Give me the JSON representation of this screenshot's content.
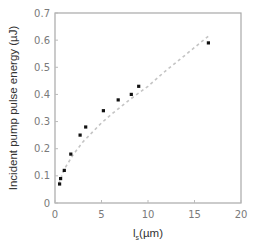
{
  "chart_data": {
    "type": "scatter",
    "title": "",
    "xlabel": "l_s(µm)",
    "xlabel_main": "l",
    "xlabel_sub": "s",
    "xlabel_unit": "(µm)",
    "ylabel": "Incident pump pulse energy (µJ)",
    "xlim": [
      0,
      20
    ],
    "ylim": [
      0,
      0.7
    ],
    "x_ticks": [
      "0",
      "5",
      "10",
      "15",
      "20"
    ],
    "y_ticks": [
      "0",
      "0.1",
      "0.2",
      "0.3",
      "0.4",
      "0.5",
      "0.6",
      "0.7"
    ],
    "grid": false,
    "legend": null,
    "series": [
      {
        "name": "measured",
        "style": "markers",
        "color": "#111111",
        "x": [
          0.5,
          0.6,
          1.0,
          1.7,
          2.7,
          3.3,
          5.2,
          6.8,
          8.2,
          9.0,
          16.5
        ],
        "y": [
          0.07,
          0.09,
          0.12,
          0.18,
          0.25,
          0.28,
          0.34,
          0.38,
          0.4,
          0.43,
          0.59
        ]
      },
      {
        "name": "fit",
        "style": "dashed-line",
        "color": "#c0c0c0",
        "x": [
          0.4,
          1,
          2,
          3,
          4,
          5,
          6,
          8,
          10,
          12,
          14,
          16.5
        ],
        "y": [
          0.07,
          0.125,
          0.18,
          0.225,
          0.26,
          0.295,
          0.325,
          0.38,
          0.43,
          0.49,
          0.545,
          0.615
        ]
      }
    ]
  }
}
